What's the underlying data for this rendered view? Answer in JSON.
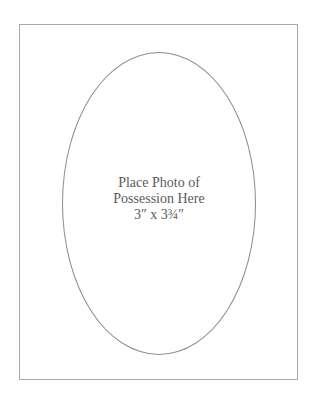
{
  "placeholder": {
    "lines": [
      "Place Photo of",
      "Possession Here",
      "3″ x 3¾″"
    ]
  },
  "colors": {
    "frame_border": "#a8a8a8",
    "oval_border": "#8c8c8c",
    "text": "#5a5a5a",
    "background": "#ffffff"
  }
}
